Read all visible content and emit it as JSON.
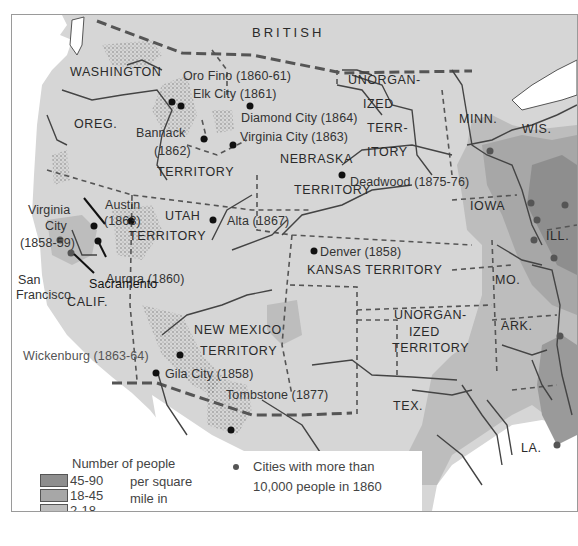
{
  "map": {
    "colors": {
      "land_base": "#d6d6d6",
      "density_45_90": "#8e8e8e",
      "density_18_45": "#a7a7a7",
      "density_2_18": "#bdbdbd",
      "density_0_2": "#d9d9d9",
      "water": "#ffffff",
      "boundary": "#555555",
      "city_dot": "#111111"
    },
    "regions": [
      {
        "id": "british",
        "label": "BRITISH"
      },
      {
        "id": "washington",
        "label": "WASHINGTON"
      },
      {
        "id": "oreg",
        "label": "OREG."
      },
      {
        "id": "territory-wa",
        "label": "TERRITORY"
      },
      {
        "id": "unorganized-north-1",
        "label": "UNORGAN-"
      },
      {
        "id": "unorganized-north-2",
        "label": "IZED"
      },
      {
        "id": "unorganized-north-3",
        "label": "TERR-"
      },
      {
        "id": "unorganized-north-4",
        "label": "ITORY"
      },
      {
        "id": "minn",
        "label": "MINN."
      },
      {
        "id": "wis",
        "label": "WIS."
      },
      {
        "id": "nebraska",
        "label": "NEBRASKA"
      },
      {
        "id": "nebraska-territory",
        "label": "TERRITORY"
      },
      {
        "id": "iowa",
        "label": "IOWA"
      },
      {
        "id": "ill",
        "label": "ILL."
      },
      {
        "id": "utah",
        "label": "UTAH"
      },
      {
        "id": "utah-territory",
        "label": "TERRITORY"
      },
      {
        "id": "kansas",
        "label": "KANSAS TERRITORY"
      },
      {
        "id": "mo",
        "label": "MO."
      },
      {
        "id": "calif",
        "label": "CALIF."
      },
      {
        "id": "new-mexico",
        "label": "NEW MEXICO"
      },
      {
        "id": "new-mexico-territory",
        "label": "TERRITORY"
      },
      {
        "id": "unorganized-south-1",
        "label": "UNORGAN-"
      },
      {
        "id": "unorganized-south-2",
        "label": "IZED"
      },
      {
        "id": "unorganized-south-3",
        "label": "TERRITORY"
      },
      {
        "id": "ark",
        "label": "ARK."
      },
      {
        "id": "tex",
        "label": "TEX."
      },
      {
        "id": "la",
        "label": "LA."
      }
    ],
    "cities": [
      {
        "name": "Oro Fino (1860-61)"
      },
      {
        "name": "Elk City (1861)"
      },
      {
        "name": "Diamond City (1864)"
      },
      {
        "name": "Bannack"
      },
      {
        "name": "(1862)"
      },
      {
        "name": "Virginia City (1863)"
      },
      {
        "name": "Deadwood (1875-76)"
      },
      {
        "name": "Virginia"
      },
      {
        "name": "City"
      },
      {
        "name": "(1858-59)"
      },
      {
        "name": "Austin"
      },
      {
        "name": "(1863)"
      },
      {
        "name": "Alta (1867)"
      },
      {
        "name": "Aurora (1860)"
      },
      {
        "name": "San"
      },
      {
        "name": "Francisco"
      },
      {
        "name": "Sacramento"
      },
      {
        "name": "Denver (1858)"
      },
      {
        "name": "Wickenburg (1863-64)"
      },
      {
        "name": "Gila City (1858)"
      },
      {
        "name": "Tombstone (1877)"
      }
    ]
  },
  "legend": {
    "density_title": "Number of people",
    "density_unit_lines": [
      "per square",
      "mile in",
      "1860"
    ],
    "density_classes": [
      {
        "label": "45-90",
        "color": "#8e8e8e"
      },
      {
        "label": "18-45",
        "color": "#a7a7a7"
      },
      {
        "label": "2-18",
        "color": "#bdbdbd"
      },
      {
        "label": "0-2",
        "color": "#d9d9d9"
      }
    ],
    "city_line1": "Cities with more than",
    "city_line2": "10,000 people in 1860",
    "ore_label": "Ore area"
  }
}
